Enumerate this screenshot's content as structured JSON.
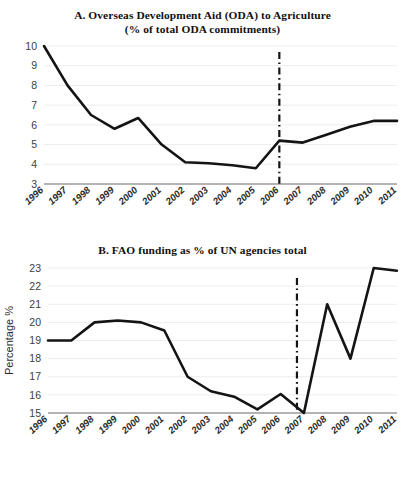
{
  "figure": {
    "background": "#ffffff",
    "line_color": "#141414",
    "grid_color": "#ececec",
    "axis_color": "#9a9a9a"
  },
  "panels": [
    {
      "id": "a",
      "title": "A.  Overseas Development Aid (ODA) to Agriculture",
      "subtitle": "(% of total ODA commitments)",
      "ylabel": "",
      "marker_label": "2006"
    },
    {
      "id": "b",
      "title": "B.  FAO funding as % of UN agencies total",
      "subtitle": "",
      "ylabel": "Percentage %",
      "marker_label": "2007"
    }
  ],
  "chart_data": [
    {
      "type": "line",
      "panel": "A",
      "title": "A.  Overseas Development Aid (ODA) to Agriculture (% of total ODA commitments)",
      "xlabel": "",
      "ylabel": "",
      "categories": [
        "1996",
        "1997",
        "1998",
        "1999",
        "2000",
        "2001",
        "2002",
        "2003",
        "2004",
        "2005",
        "2006",
        "2007",
        "2008",
        "2009",
        "2010",
        "2011"
      ],
      "values": [
        10.0,
        8.0,
        6.5,
        5.8,
        6.35,
        5.0,
        4.1,
        4.05,
        3.95,
        3.8,
        5.2,
        5.1,
        5.5,
        5.9,
        6.2,
        6.2
      ],
      "series": [
        {
          "name": "ODA to Agriculture (% of total ODA commitments)",
          "points": [
            {
              "x": "1996",
              "y": 10.0
            },
            {
              "x": "1997",
              "y": 8.0
            },
            {
              "x": "1998",
              "y": 6.5
            },
            {
              "x": "1999",
              "y": 5.8
            },
            {
              "x": "2000",
              "y": 6.35
            },
            {
              "x": "2001",
              "y": 5.0
            },
            {
              "x": "2002",
              "y": 4.1
            },
            {
              "x": "2003",
              "y": 4.05
            },
            {
              "x": "2004",
              "y": 3.95
            },
            {
              "x": "2005",
              "y": 3.8
            },
            {
              "x": "2006",
              "y": 5.2
            },
            {
              "x": "2007",
              "y": 5.1
            },
            {
              "x": "2008",
              "y": 5.5
            },
            {
              "x": "2009",
              "y": 5.9
            },
            {
              "x": "2010",
              "y": 6.2
            }
          ]
        }
      ],
      "ylim": [
        3,
        10
      ],
      "yticks": [
        3,
        4,
        5,
        6,
        7,
        8,
        9,
        10
      ],
      "xticks": [
        "1996",
        "1997",
        "1998",
        "1999",
        "2000",
        "2001",
        "2002",
        "2003",
        "2004",
        "2005",
        "2006",
        "2007",
        "2008",
        "2009",
        "2010",
        "2011"
      ],
      "grid": true,
      "legend": "none",
      "annotations": [
        {
          "type": "vertical-dash-dot-line",
          "at": "2006",
          "label": "2006"
        }
      ]
    },
    {
      "type": "line",
      "panel": "B",
      "title": "B.  FAO funding as % of UN agencies total",
      "xlabel": "",
      "ylabel": "Percentage %",
      "categories": [
        "1996",
        "1997",
        "1998",
        "1999",
        "2000",
        "2001",
        "2002",
        "2003",
        "2004",
        "2005",
        "2006",
        "2007",
        "2008",
        "2009",
        "2010",
        "2011"
      ],
      "values": [
        19.0,
        19.0,
        20.0,
        20.1,
        20.0,
        19.55,
        17.0,
        16.2,
        15.9,
        15.2,
        16.05,
        15.0,
        21.0,
        18.0,
        23.0,
        22.85
      ],
      "series": [
        {
          "name": "FAO funding as % of UN agencies total",
          "points": [
            {
              "x": "1996",
              "y": 19.0
            },
            {
              "x": "1997",
              "y": 19.0
            },
            {
              "x": "1998",
              "y": 20.0
            },
            {
              "x": "1999",
              "y": 20.1
            },
            {
              "x": "2000",
              "y": 20.0
            },
            {
              "x": "2001",
              "y": 19.55
            },
            {
              "x": "2002",
              "y": 17.0
            },
            {
              "x": "2003",
              "y": 16.2
            },
            {
              "x": "2004",
              "y": 15.9
            },
            {
              "x": "2005",
              "y": 15.2
            },
            {
              "x": "2006",
              "y": 16.05
            },
            {
              "x": "2007",
              "y": 15.0
            },
            {
              "x": "2008",
              "y": 21.0
            },
            {
              "x": "2009",
              "y": 18.0
            },
            {
              "x": "2010",
              "y": 23.0
            },
            {
              "x": "2011",
              "y": 22.85
            }
          ]
        }
      ],
      "ylim": [
        15,
        23
      ],
      "yticks": [
        15,
        16,
        17,
        18,
        19,
        20,
        21,
        22,
        23
      ],
      "xticks": [
        "1996",
        "1997",
        "1998",
        "1999",
        "2000",
        "2001",
        "2002",
        "2003",
        "2004",
        "2005",
        "2006",
        "2007",
        "2008",
        "2009",
        "2010",
        "2011"
      ],
      "grid": true,
      "legend": "none",
      "annotations": [
        {
          "type": "vertical-dash-dot-line",
          "at": "2006.7",
          "label": "2007"
        }
      ]
    }
  ]
}
